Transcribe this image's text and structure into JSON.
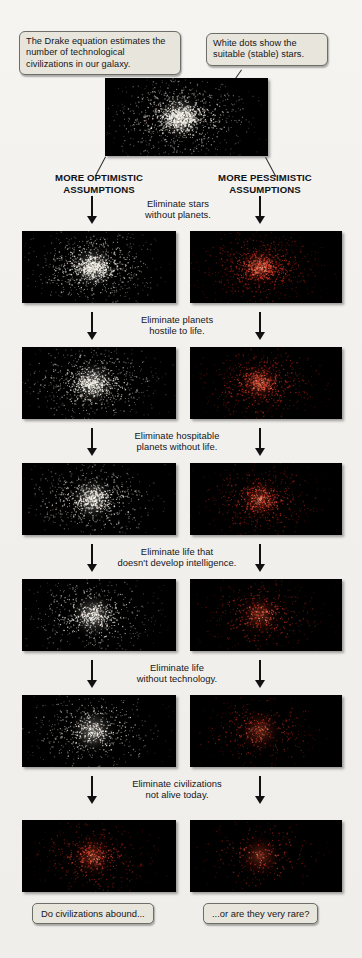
{
  "figure": {
    "background_color": "#f1f0ec",
    "panel_background": "#000000",
    "optimistic_star_color": "#ffffff",
    "pessimistic_star_color": "#cc2211",
    "callout_fill": "#e7e5dc",
    "callout_border": "#6e6e68"
  },
  "callouts": [
    {
      "name": "drake-equation-callout",
      "text": "The Drake equation estimates the number of technological civilizations in our galaxy."
    },
    {
      "name": "white-dots-callout",
      "text": "White dots show the suitable (stable) stars."
    }
  ],
  "columns": {
    "left": {
      "label": "MORE OPTIMISTIC ASSUMPTIONS",
      "line1": "MORE OPTIMISTIC",
      "line2": "ASSUMPTIONS"
    },
    "right": {
      "label": "MORE PESSIMISTIC ASSUMPTIONS",
      "line1": "MORE PESSIMISTIC",
      "line2": "ASSUMPTIONS"
    }
  },
  "steps": [
    {
      "index": 1,
      "line1": "Eliminate stars",
      "line2": "without planets."
    },
    {
      "index": 2,
      "line1": "Eliminate planets",
      "line2": "hostile to life."
    },
    {
      "index": 3,
      "line1": "Eliminate hospitable",
      "line2": "planets without life."
    },
    {
      "index": 4,
      "line1": "Eliminate life that",
      "line2": "doesn't develop intelligence."
    },
    {
      "index": 5,
      "line1": "Eliminate life",
      "line2": "without technology."
    },
    {
      "index": 6,
      "line1": "Eliminate civilizations",
      "line2": "not alive today."
    }
  ],
  "bottom_captions": [
    {
      "name": "abound-caption",
      "text": "Do civilizations abound..."
    },
    {
      "name": "rare-caption",
      "text": "...or are they very rare?"
    }
  ],
  "chart_data": {
    "type": "scatter",
    "xlabel": "",
    "ylabel": "",
    "legend": [
      "White dots = suitable (stable) stars",
      "Red dots = pessimistic survivors"
    ],
    "series": [
      {
        "name": "top-all-stars",
        "row": 0,
        "column": "both",
        "dot_count": 1400,
        "dot_color": "#ffffff",
        "core_density": 1.0
      },
      {
        "name": "optimistic-step-1",
        "row": 1,
        "column": "optimistic",
        "dot_count": 1150,
        "dot_color": "#ffffff",
        "core_density": 0.92
      },
      {
        "name": "pessimistic-step-1",
        "row": 1,
        "column": "pessimistic",
        "dot_count": 950,
        "dot_color": "#d8cfc8",
        "core_density": 0.8
      },
      {
        "name": "optimistic-step-2",
        "row": 2,
        "column": "optimistic",
        "dot_count": 1000,
        "dot_color": "#ffffff",
        "core_density": 0.84
      },
      {
        "name": "pessimistic-step-2",
        "row": 2,
        "column": "pessimistic",
        "dot_count": 780,
        "dot_color": "#dd6644",
        "core_density": 0.62
      },
      {
        "name": "optimistic-step-3",
        "row": 3,
        "column": "optimistic",
        "dot_count": 880,
        "dot_color": "#ffffff",
        "core_density": 0.76
      },
      {
        "name": "pessimistic-step-3",
        "row": 3,
        "column": "pessimistic",
        "dot_count": 640,
        "dot_color": "#dd4422",
        "core_density": 0.5
      },
      {
        "name": "optimistic-step-4",
        "row": 4,
        "column": "optimistic",
        "dot_count": 760,
        "dot_color": "#ffffff",
        "core_density": 0.66
      },
      {
        "name": "pessimistic-step-4",
        "row": 4,
        "column": "pessimistic",
        "dot_count": 520,
        "dot_color": "#cc3318",
        "core_density": 0.4
      },
      {
        "name": "optimistic-step-5",
        "row": 5,
        "column": "optimistic",
        "dot_count": 650,
        "dot_color": "#ffffff",
        "core_density": 0.56
      },
      {
        "name": "pessimistic-step-5",
        "row": 5,
        "column": "pessimistic",
        "dot_count": 400,
        "dot_color": "#c02a12",
        "core_density": 0.3
      },
      {
        "name": "optimistic-step-6",
        "row": 6,
        "column": "optimistic",
        "dot_count": 520,
        "dot_color": "#ffdfd2",
        "core_density": 0.46
      },
      {
        "name": "pessimistic-step-6",
        "row": 6,
        "column": "pessimistic",
        "dot_count": 300,
        "dot_color": "#b52510",
        "core_density": 0.22
      }
    ]
  }
}
